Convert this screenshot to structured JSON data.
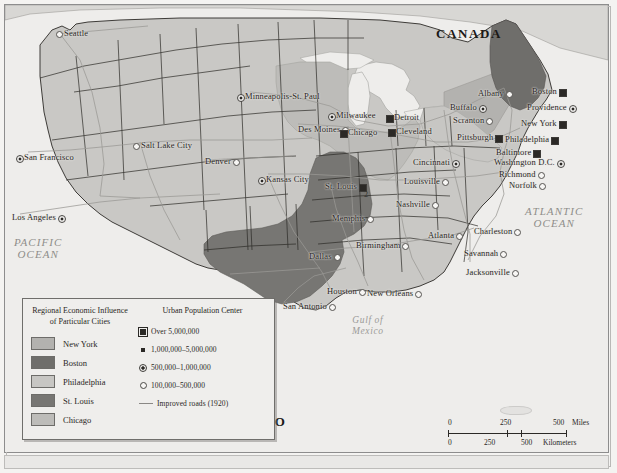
{
  "map": {
    "title": "Regional Economic Influence of Particular Cities",
    "countries": [
      {
        "name": "CANADA",
        "x": 436,
        "y": 26
      },
      {
        "name": "MEXICO",
        "x": 222,
        "y": 414
      }
    ],
    "oceans": [
      {
        "name": "PACIFIC\nOCEAN",
        "x": 14,
        "y": 236
      },
      {
        "name": "ATLANTIC\nOCEAN",
        "x": 525,
        "y": 205
      }
    ],
    "water_bodies": [
      {
        "name": "Gulf of\nMexico",
        "x": 352,
        "y": 315
      }
    ],
    "cities": [
      {
        "name": "Seattle",
        "x": 64,
        "y": 28,
        "size": "100,000-500,000",
        "anchor": "right"
      },
      {
        "name": "San Francisco",
        "x": 24,
        "y": 152,
        "size": "500,000-1,000,000",
        "anchor": "right"
      },
      {
        "name": "Los Angeles",
        "x": 12,
        "y": 212,
        "size": "500,000-1,000,000",
        "anchor": "left"
      },
      {
        "name": "Salt Lake City",
        "x": 141,
        "y": 140,
        "size": "100,000-500,000",
        "anchor": "right"
      },
      {
        "name": "Denver",
        "x": 205,
        "y": 156,
        "size": "100,000-500,000",
        "anchor": "left"
      },
      {
        "name": "Minneapolis-St. Paul",
        "x": 245,
        "y": 91,
        "size": "500,000-1,000,000",
        "anchor": "right"
      },
      {
        "name": "Des Moines",
        "x": 298,
        "y": 124,
        "size": "100,000-500,000",
        "anchor": "left"
      },
      {
        "name": "Milwaukee",
        "x": 336,
        "y": 110,
        "size": "500,000-1,000,000",
        "anchor": "right"
      },
      {
        "name": "Chicago",
        "x": 348,
        "y": 127,
        "size": "Over 5,000,000",
        "anchor": "right"
      },
      {
        "name": "Detroit",
        "x": 394,
        "y": 112,
        "size": "Over 5,000,000",
        "anchor": "right"
      },
      {
        "name": "Cleveland",
        "x": 396,
        "y": 126,
        "size": "Over 5,000,000",
        "anchor": "right"
      },
      {
        "name": "Buffalo",
        "x": 450,
        "y": 102,
        "size": "500,000-1,000,000",
        "anchor": "left"
      },
      {
        "name": "Albany",
        "x": 478,
        "y": 88,
        "size": "100,000-500,000",
        "anchor": "left"
      },
      {
        "name": "Boston",
        "x": 532,
        "y": 86,
        "size": "Over 5,000,000",
        "anchor": "left"
      },
      {
        "name": "Providence",
        "x": 527,
        "y": 102,
        "size": "500,000-1,000,000",
        "anchor": "left"
      },
      {
        "name": "Scranton",
        "x": 453,
        "y": 115,
        "size": "100,000-500,000",
        "anchor": "left"
      },
      {
        "name": "New York",
        "x": 521,
        "y": 118,
        "size": "Over 5,000,000",
        "anchor": "left"
      },
      {
        "name": "Pittsburgh",
        "x": 457,
        "y": 132,
        "size": "Over 5,000,000",
        "anchor": "left"
      },
      {
        "name": "Philadelphia",
        "x": 505,
        "y": 134,
        "size": "Over 5,000,000",
        "anchor": "left"
      },
      {
        "name": "Baltimore",
        "x": 496,
        "y": 147,
        "size": "Over 5,000,000",
        "anchor": "left"
      },
      {
        "name": "Washington D.C.",
        "x": 494,
        "y": 157,
        "size": "500,000-1,000,000",
        "anchor": "left"
      },
      {
        "name": "Richmond",
        "x": 499,
        "y": 169,
        "size": "100,000-500,000",
        "anchor": "left"
      },
      {
        "name": "Norfolk",
        "x": 509,
        "y": 180,
        "size": "100,000-500,000",
        "anchor": "left"
      },
      {
        "name": "Cincinnati",
        "x": 413,
        "y": 157,
        "size": "500,000-1,000,000",
        "anchor": "left"
      },
      {
        "name": "Louisville",
        "x": 404,
        "y": 176,
        "size": "100,000-500,000",
        "anchor": "left"
      },
      {
        "name": "Kansas City",
        "x": 266,
        "y": 174,
        "size": "500,000-1,000,000",
        "anchor": "right"
      },
      {
        "name": "St. Louis",
        "x": 325,
        "y": 181,
        "size": "Over 5,000,000",
        "anchor": "left"
      },
      {
        "name": "Nashville",
        "x": 396,
        "y": 199,
        "size": "100,000-500,000",
        "anchor": "left"
      },
      {
        "name": "Memphis",
        "x": 332,
        "y": 213,
        "size": "100,000-500,000",
        "anchor": "left"
      },
      {
        "name": "Atlanta",
        "x": 428,
        "y": 230,
        "size": "100,000-500,000",
        "anchor": "left"
      },
      {
        "name": "Charleston",
        "x": 474,
        "y": 226,
        "size": "100,000-500,000",
        "anchor": "left"
      },
      {
        "name": "Birmingham",
        "x": 356,
        "y": 240,
        "size": "100,000-500,000",
        "anchor": "left"
      },
      {
        "name": "Savannah",
        "x": 464,
        "y": 248,
        "size": "100,000-500,000",
        "anchor": "left"
      },
      {
        "name": "Dallas",
        "x": 309,
        "y": 251,
        "size": "100,000-500,000",
        "anchor": "left"
      },
      {
        "name": "Jacksonville",
        "x": 466,
        "y": 267,
        "size": "100,000-500,000",
        "anchor": "left"
      },
      {
        "name": "Houston",
        "x": 327,
        "y": 286,
        "size": "100,000-500,000",
        "anchor": "left"
      },
      {
        "name": "New Orleans",
        "x": 367,
        "y": 288,
        "size": "100,000-500,000",
        "anchor": "left"
      },
      {
        "name": "San Antonio",
        "x": 283,
        "y": 301,
        "size": "100,000-500,000",
        "anchor": "left"
      }
    ],
    "page_marker": "2"
  },
  "legend": {
    "influence": {
      "title": "Regional Economic Influence of Particular Cities",
      "items": [
        {
          "label": "New York",
          "color": "#b3b2af"
        },
        {
          "label": "Boston",
          "color": "#6f6e6b"
        },
        {
          "label": "Philadelphia",
          "color": "#c7c6c3"
        },
        {
          "label": "St. Louis",
          "color": "#777673"
        },
        {
          "label": "Chicago",
          "color": "#bdbcb9"
        }
      ]
    },
    "population": {
      "title": "Urban Population Center",
      "items": [
        {
          "label": "Over 5,000,000",
          "symbol": "square-outlined-icon"
        },
        {
          "label": "1,000,000–5,000,000",
          "symbol": "square-small-icon"
        },
        {
          "label": "500,000–1,000,000",
          "symbol": "circle-dot-icon"
        },
        {
          "label": "100,000–500,000",
          "symbol": "circle-open-icon"
        }
      ],
      "roads_label": "Improved roads (1920)",
      "roads_symbol": "line-icon"
    }
  },
  "scale": {
    "miles": {
      "ticks": [
        "0",
        "250",
        "500"
      ],
      "unit": "Miles"
    },
    "kilometers": {
      "ticks": [
        "0",
        "250",
        "500"
      ],
      "unit": "Kilometers"
    }
  },
  "colors": {
    "land": "#c9c8c5",
    "water": "#eeedeb",
    "new_york_zone": "#b3b2af",
    "boston_zone": "#6f6e6b",
    "philadelphia_zone": "#c7c6c3",
    "st_louis_zone": "#777673",
    "chicago_zone": "#bdbcb9",
    "border": "#2b2926",
    "road": "#9b9996"
  }
}
